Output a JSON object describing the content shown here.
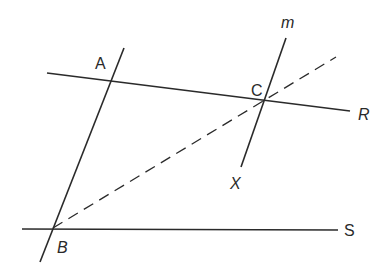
{
  "diagram": {
    "labels": {
      "A": "A",
      "B": "B",
      "C": "C",
      "m": "m",
      "R": "R",
      "S": "S",
      "X": "X"
    },
    "lines": [
      {
        "name": "line-AR",
        "from": [
          47,
          73
        ],
        "to": [
          350,
          111
        ],
        "style": "solid"
      },
      {
        "name": "line-AB",
        "from": [
          124,
          48
        ],
        "to": [
          40,
          262
        ],
        "style": "solid"
      },
      {
        "name": "line-BS",
        "from": [
          22,
          229
        ],
        "to": [
          338,
          230
        ],
        "style": "solid"
      },
      {
        "name": "line-m",
        "from": [
          286,
          38
        ],
        "to": [
          241,
          167
        ],
        "style": "solid"
      },
      {
        "name": "line-BC-dashed",
        "from": [
          53,
          228
        ],
        "to": [
          336,
          57
        ],
        "style": "dashed"
      }
    ],
    "stroke_color": "#2a2a2a"
  }
}
